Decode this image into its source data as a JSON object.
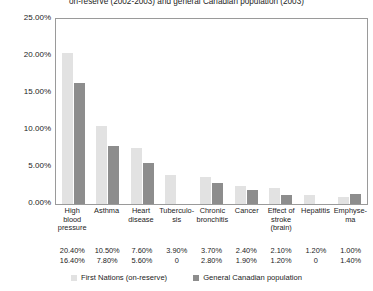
{
  "chart_data": {
    "type": "bar",
    "title": "on-reserve (2002-2003) and general Canadian population (2003)",
    "xlabel": "",
    "ylabel": "",
    "ylim": [
      0,
      25
    ],
    "grid": false,
    "legend_position": "bottom",
    "ytick_labels": [
      "25.00%",
      "20.00%",
      "15.00%",
      "10.00%",
      "5.00%",
      "0.00%"
    ],
    "ytick_values": [
      25,
      20,
      15,
      10,
      5,
      0
    ],
    "categories": [
      "High blood pressure",
      "Asthma",
      "Heart disease",
      "Tuberculo- sis",
      "Chronic bronchitis",
      "Cancer",
      "Effect of stroke (brain)",
      "Hepatitis",
      "Emphyse- ma"
    ],
    "category_lines": [
      [
        "High",
        "blood",
        "pressure"
      ],
      [
        "Asthma"
      ],
      [
        "Heart",
        "disease"
      ],
      [
        "Tuberculo-",
        "sis"
      ],
      [
        "Chronic",
        "bronchitis"
      ],
      [
        "Cancer"
      ],
      [
        "Effect of",
        "stroke",
        "(brain)"
      ],
      [
        "Hepatitis"
      ],
      [
        "Emphyse-",
        "ma"
      ]
    ],
    "series": [
      {
        "name": "First Nations (on-reserve)",
        "color": "#e2e2e2",
        "values": [
          20.4,
          10.5,
          7.6,
          3.9,
          3.7,
          2.4,
          2.1,
          1.2,
          1.0
        ],
        "labels": [
          "20.40%",
          "10.50%",
          "7.60%",
          "3.90%",
          "3.70%",
          "2.40%",
          "2.10%",
          "1.20%",
          "1.00%"
        ]
      },
      {
        "name": "General Canadian population",
        "color": "#8d8d8d",
        "values": [
          16.4,
          7.8,
          5.6,
          0,
          2.8,
          1.9,
          1.2,
          0,
          1.4
        ],
        "labels": [
          "16.40%",
          "7.80%",
          "5.60%",
          "0",
          "2.80%",
          "1.90%",
          "1.20%",
          "0",
          "1.40%"
        ]
      }
    ]
  }
}
